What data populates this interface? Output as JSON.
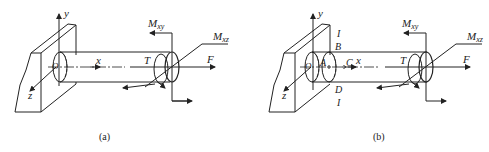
{
  "figure_a": {
    "caption": "(a)",
    "labels": {
      "y": "y",
      "x": "x",
      "z": "z",
      "o": "O",
      "T": "T",
      "F": "F",
      "Mxy": "M",
      "Mxy_sub": "xy",
      "Mxz": "M",
      "Mxz_sub": "xz"
    }
  },
  "figure_b": {
    "caption": "(b)",
    "labels": {
      "y": "y",
      "x": "x",
      "z": "z",
      "o": "O",
      "T": "T",
      "F": "F",
      "Mxy": "M",
      "Mxy_sub": "xy",
      "Mxz": "M",
      "Mxz_sub": "xz",
      "A": "A",
      "B": "B",
      "C": "C",
      "D": "D",
      "I_top": "I",
      "I_bottom": "I"
    }
  }
}
